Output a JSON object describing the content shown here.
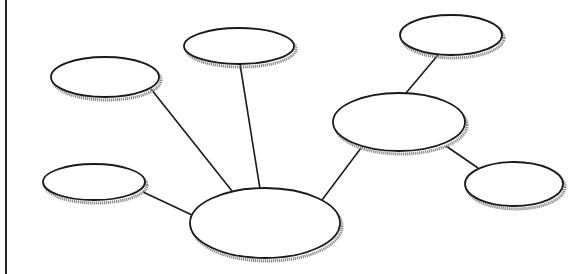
{
  "diagram": {
    "type": "concept-web",
    "colors": {
      "stroke": "#1a1a1a",
      "fill": "#ffffff",
      "shadow": "#8a8a8a",
      "background": "#ffffff"
    },
    "nodes": [
      {
        "id": "center",
        "cx": 265,
        "cy": 223,
        "rx": 75,
        "ry": 35,
        "label": ""
      },
      {
        "id": "top-left",
        "cx": 105,
        "cy": 77,
        "rx": 54,
        "ry": 20,
        "label": ""
      },
      {
        "id": "top-center",
        "cx": 239,
        "cy": 46,
        "rx": 55,
        "ry": 18,
        "label": ""
      },
      {
        "id": "bottom-left",
        "cx": 94,
        "cy": 182,
        "rx": 51,
        "ry": 18,
        "label": ""
      },
      {
        "id": "right-hub",
        "cx": 399,
        "cy": 122,
        "rx": 66,
        "ry": 29,
        "label": ""
      },
      {
        "id": "top-right",
        "cx": 451,
        "cy": 35,
        "rx": 51,
        "ry": 20,
        "label": ""
      },
      {
        "id": "bottom-right",
        "cx": 514,
        "cy": 184,
        "rx": 49,
        "ry": 22,
        "label": ""
      }
    ],
    "edges": [
      {
        "from": "top-left",
        "to": "center",
        "x1": 151,
        "y1": 89,
        "x2": 232,
        "y2": 191
      },
      {
        "from": "top-center",
        "to": "center",
        "x1": 240,
        "y1": 64,
        "x2": 260,
        "y2": 189
      },
      {
        "from": "bottom-left",
        "to": "center",
        "x1": 143,
        "y1": 192,
        "x2": 192,
        "y2": 215
      },
      {
        "from": "right-hub",
        "to": "center",
        "x1": 361,
        "y1": 148,
        "x2": 322,
        "y2": 200
      },
      {
        "from": "top-right",
        "to": "right-hub",
        "x1": 438,
        "y1": 55,
        "x2": 406,
        "y2": 93
      },
      {
        "from": "right-hub",
        "to": "bottom-right",
        "x1": 446,
        "y1": 146,
        "x2": 478,
        "y2": 168
      }
    ]
  }
}
